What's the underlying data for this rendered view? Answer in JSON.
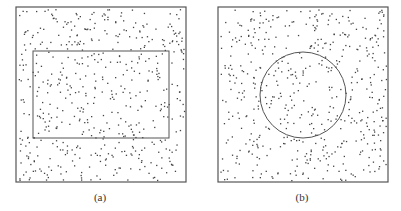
{
  "figure": {
    "panels": [
      {
        "id": "a",
        "label": "(a)",
        "outer_box": {
          "x": 16,
          "y": 7,
          "w": 170,
          "h": 175
        },
        "inner_shape": {
          "type": "rectangle",
          "x": 33,
          "y": 51,
          "w": 136,
          "h": 87
        },
        "points": 520,
        "seed": 7
      },
      {
        "id": "b",
        "label": "(b)",
        "outer_box": {
          "x": 218,
          "y": 7,
          "w": 170,
          "h": 175
        },
        "inner_shape": {
          "type": "circle",
          "cx": 303,
          "cy": 95,
          "r": 43
        },
        "points": 520,
        "seed": 13
      }
    ],
    "colors": {
      "stroke": "#555555",
      "dot": "#444444"
    }
  }
}
